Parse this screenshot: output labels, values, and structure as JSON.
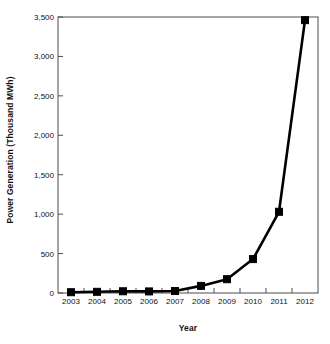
{
  "chart_data": {
    "type": "line",
    "title": "",
    "xlabel": "Year",
    "ylabel": "Power Generation (Thousand MWh)",
    "categories": [
      "2003",
      "2004",
      "2005",
      "2006",
      "2007",
      "2008",
      "2009",
      "2010",
      "2011",
      "2012"
    ],
    "x": [
      2003,
      2004,
      2005,
      2006,
      2007,
      2008,
      2009,
      2010,
      2011,
      2012
    ],
    "values": [
      10,
      15,
      22,
      20,
      25,
      90,
      175,
      430,
      1030,
      3460
    ],
    "series": [
      {
        "name": "Power Generation",
        "values": [
          10,
          15,
          22,
          20,
          25,
          90,
          175,
          430,
          1030,
          3460
        ]
      }
    ],
    "ylim": [
      0,
      3500
    ],
    "yticks": [
      0,
      500,
      1000,
      1500,
      2000,
      2500,
      3000,
      3500
    ],
    "ytick_labels": [
      "0",
      "500",
      "1,000",
      "1,500",
      "2,000",
      "2,500",
      "3,000",
      "3,500"
    ],
    "xtick_labels": [
      "2003",
      "2004",
      "2005",
      "2006",
      "2007",
      "2008",
      "2009",
      "2010",
      "2011",
      "2012"
    ],
    "grid": false,
    "legend": false,
    "legend_position": "none",
    "marker": "square",
    "line_color": "#000000",
    "marker_color": "#000000",
    "background_color": "#ffffff",
    "axis_color": "#4d4d4d"
  }
}
